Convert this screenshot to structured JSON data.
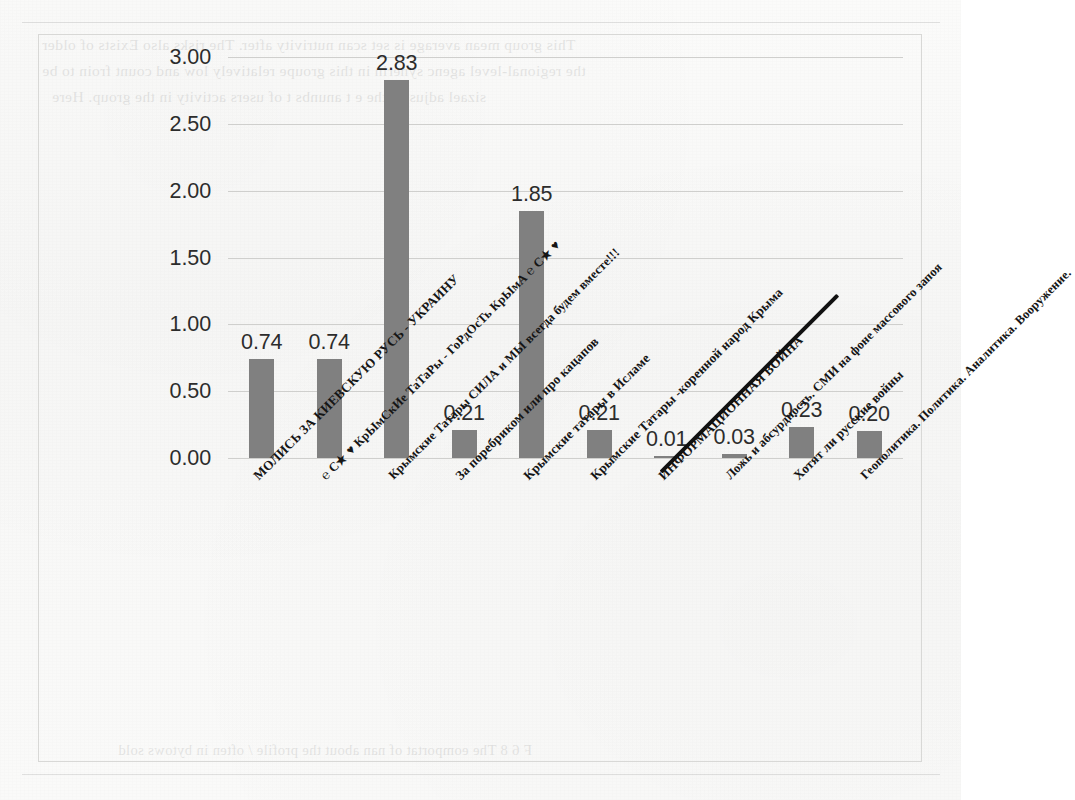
{
  "chart_data": {
    "type": "bar",
    "title": "",
    "xlabel": "",
    "ylabel": "",
    "ylim": [
      0,
      3.0
    ],
    "ytick_step": 0.5,
    "grid": true,
    "legend": "none",
    "bar_color": "#808080",
    "yticks": [
      "0.00",
      "0.50",
      "1.00",
      "1.50",
      "2.00",
      "2.50",
      "3.00"
    ],
    "categories": [
      "МОЛИСЬ ЗА КИЕВСКУЮ РУСЬ - УКРАИНУ",
      "℮ С★ ♥ КрЫмСкИе ТаТаРы - ГоРдОсТь КрЫмА ℮ С★ ♥",
      "Крымские Татары СИЛА и МЫ всегда будем вместе!!!",
      "За поребриком или про кацапов",
      "Крымские татары в Исламе",
      "Крымские Татары -коренной народ Крыма",
      "ИНФОРМАЦИОННАЯ ВОЙНА",
      "Ложь и абсурдность. СМИ на фоне массового запоя",
      "Хотят ли русские войны",
      "Геополитика. Политика. Аналитика. Вооружение."
    ],
    "values": [
      0.74,
      0.74,
      2.83,
      0.21,
      1.85,
      0.21,
      0.01,
      0.03,
      0.23,
      0.2
    ],
    "value_labels": [
      "0.74",
      "0.74",
      "2.83",
      "0.21",
      "1.85",
      "0.21",
      "0.01",
      "0.03",
      "0.23",
      "0.20"
    ]
  },
  "bleed_through": {
    "top_lines": [
      "This group mean average is set scan nutrivity after. The risks also Exists of older",
      "the regional-level agenc synerin in this groupe relatively low and count froin to be",
      "sizael adjustit, the e  t anunbs t  of users activity in the group. Here",
      "F 6  8   The eomportat of nan about the profile / often in bytows sold"
    ]
  }
}
